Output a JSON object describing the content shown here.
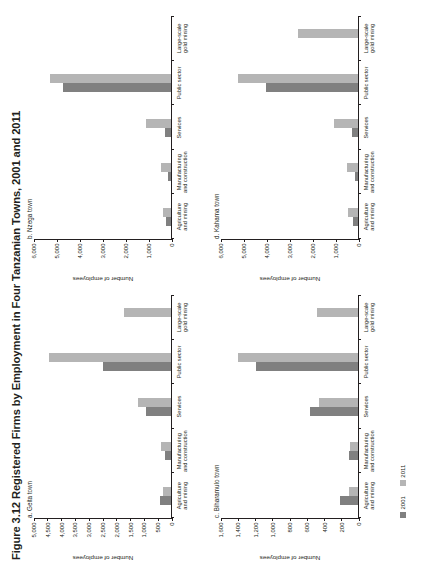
{
  "figure": {
    "title": "Figure 3.12  Registered Firms by Employment in Four Tanzanian Towns, 2001 and 2011",
    "ylabel": "Number of employees",
    "legend": [
      {
        "label": "2001",
        "color": "#808080"
      },
      {
        "label": "2011",
        "color": "#b5b5b5"
      }
    ]
  },
  "categories": [
    "Agriculture\nand mining",
    "Manufacturing\nand construction",
    "Services",
    "Public sector",
    "Large-scale\ngold mining"
  ],
  "chart_data": [
    {
      "type": "bar",
      "title": "a. Geita town",
      "panel_id": "a",
      "xlabel": "",
      "ylabel": "Number of employees",
      "ylim": [
        0,
        5000
      ],
      "yticks": [
        0,
        500,
        1000,
        1500,
        2000,
        2500,
        3000,
        3500,
        4000,
        4500,
        5000
      ],
      "ytick_labels": [
        "0",
        "500",
        "1,000",
        "1,500",
        "2,000",
        "2,500",
        "3,000",
        "3,500",
        "4,000",
        "4,500",
        "5,000"
      ],
      "grid": false,
      "legend_position": "bottom",
      "categories": [
        "Agriculture and mining",
        "Manufacturing and construction",
        "Services",
        "Public sector",
        "Large-scale gold mining"
      ],
      "series": [
        {
          "name": "2001",
          "color": "#808080",
          "values": [
            390,
            230,
            900,
            2450,
            0
          ]
        },
        {
          "name": "2011",
          "color": "#b5b5b5",
          "values": [
            300,
            370,
            1180,
            4430,
            1700
          ]
        }
      ]
    },
    {
      "type": "bar",
      "title": "b. Nzega town",
      "panel_id": "b",
      "xlabel": "",
      "ylabel": "Number of employees",
      "ylim": [
        0,
        6000
      ],
      "yticks": [
        0,
        1000,
        2000,
        3000,
        4000,
        5000,
        6000
      ],
      "ytick_labels": [
        "0",
        "1,000",
        "2,000",
        "3,000",
        "4,000",
        "5,000",
        "6,000"
      ],
      "grid": false,
      "legend_position": "bottom",
      "categories": [
        "Agriculture and mining",
        "Manufacturing and construction",
        "Services",
        "Public sector",
        "Large-scale gold mining"
      ],
      "series": [
        {
          "name": "2001",
          "color": "#808080",
          "values": [
            210,
            140,
            260,
            4700,
            0
          ]
        },
        {
          "name": "2011",
          "color": "#b5b5b5",
          "values": [
            330,
            440,
            1080,
            5250,
            0
          ]
        }
      ]
    },
    {
      "type": "bar",
      "title": "c. Biharamulo town",
      "panel_id": "c",
      "xlabel": "",
      "ylabel": "Number of employees",
      "ylim": [
        0,
        1600
      ],
      "yticks": [
        0,
        200,
        400,
        600,
        800,
        1000,
        1200,
        1400,
        1600
      ],
      "ytick_labels": [
        "0",
        "200",
        "400",
        "600",
        "800",
        "1,000",
        "1,200",
        "1,400",
        "1,600"
      ],
      "grid": false,
      "legend_position": "bottom",
      "categories": [
        "Agriculture and mining",
        "Manufacturing and construction",
        "Services",
        "Public sector",
        "Large-scale gold mining"
      ],
      "series": [
        {
          "name": "2001",
          "color": "#808080",
          "values": [
            210,
            110,
            560,
            1180,
            0
          ]
        },
        {
          "name": "2011",
          "color": "#b5b5b5",
          "values": [
            105,
            90,
            450,
            1390,
            480
          ]
        }
      ]
    },
    {
      "type": "bar",
      "title": "d. Kahama town",
      "panel_id": "d",
      "xlabel": "",
      "ylabel": "Number of employees",
      "ylim": [
        0,
        6000
      ],
      "yticks": [
        0,
        1000,
        2000,
        3000,
        4000,
        5000,
        6000
      ],
      "ytick_labels": [
        "0",
        "1,000",
        "2,000",
        "3,000",
        "4,000",
        "5,000",
        "6,000"
      ],
      "grid": false,
      "legend_position": "bottom",
      "categories": [
        "Agriculture and mining",
        "Manufacturing and construction",
        "Services",
        "Public sector",
        "Large-scale gold mining"
      ],
      "series": [
        {
          "name": "2001",
          "color": "#808080",
          "values": [
            230,
            130,
            250,
            3980,
            0
          ]
        },
        {
          "name": "2011",
          "color": "#b5b5b5",
          "values": [
            420,
            490,
            1030,
            5200,
            2620
          ]
        }
      ]
    }
  ]
}
